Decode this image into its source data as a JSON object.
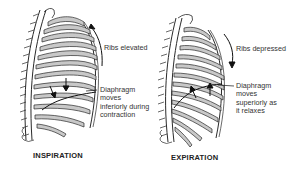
{
  "diagram": {
    "panels": [
      {
        "id": "inspiration",
        "title": "INSPIRATION",
        "rib_label": "Ribs elevated",
        "rib_arrow_direction": "up",
        "diaphragm_label_lines": [
          "Diaphragm",
          "moves",
          "inferiorly during",
          "contraction"
        ],
        "diaphragm_arrow_direction": "down"
      },
      {
        "id": "expiration",
        "title": "EXPIRATION",
        "rib_label": "Ribs depressed",
        "rib_arrow_direction": "down",
        "diaphragm_label_lines": [
          "Diaphragm",
          "moves",
          "superiorly as",
          "it relaxes"
        ],
        "diaphragm_arrow_direction": "up"
      }
    ],
    "colors": {
      "line": "#2a2a2a",
      "rib_fill": "#c8c8c8",
      "background": "#ffffff"
    }
  }
}
